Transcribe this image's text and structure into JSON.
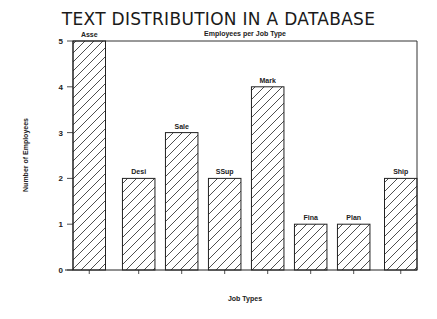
{
  "title": "TEXT DISTRIBUTION IN A DATABASE",
  "subtitle": "Employees per Job Type",
  "chart_data": {
    "type": "bar",
    "title": "TEXT DISTRIBUTION IN A DATABASE",
    "subtitle": "Employees per Job Type",
    "xlabel": "Job Types",
    "ylabel": "Number of Employees",
    "categories": [
      "Asse",
      "Desi",
      "Sale",
      "SSup",
      "Mark",
      "Fina",
      "Plan",
      "Ship"
    ],
    "values": [
      5,
      2,
      3,
      2,
      4,
      1,
      1,
      2
    ],
    "ylim": [
      0,
      5
    ],
    "yticks": [
      "0",
      "1",
      "2",
      "3",
      "4",
      "5"
    ],
    "grid": false,
    "legend": null,
    "bar_fill": "diagonal hatch",
    "colors": {
      "stroke": "#222222",
      "background": "#ffffff"
    }
  }
}
